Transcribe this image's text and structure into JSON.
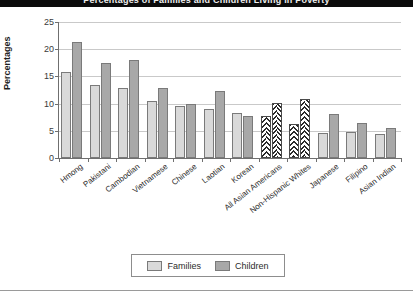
{
  "figure": {
    "title_band_text": "Percentages of Families and Children Living in Poverty",
    "legend_position": "bottom-center"
  },
  "chart_data": {
    "type": "bar",
    "title": "Percentages of Families and Children Living in Poverty",
    "xlabel": "",
    "ylabel": "Percentages",
    "ylim": [
      0,
      25
    ],
    "yticks": [
      0,
      5,
      10,
      15,
      20,
      25
    ],
    "grid": true,
    "categories": [
      "Hmong",
      "Pakistani",
      "Cambodian",
      "Vietnamese",
      "Chinese",
      "Laotian",
      "Korean",
      "All Asian Americans",
      "Non-Hispanic Whites",
      "Japanese",
      "Filipino",
      "Asian Indian"
    ],
    "series": [
      {
        "name": "Families",
        "color": "#d9d9d9",
        "values": [
          15.8,
          13.4,
          12.9,
          10.5,
          9.6,
          9.0,
          8.2,
          7.8,
          6.2,
          4.6,
          4.7,
          4.4
        ]
      },
      {
        "name": "Children",
        "color": "#a8a8a8",
        "values": [
          21.4,
          17.4,
          18.0,
          12.9,
          9.9,
          12.3,
          7.8,
          10.2,
          10.8,
          8.1,
          6.5,
          5.5
        ]
      }
    ],
    "highlighted_categories": [
      "All Asian Americans",
      "Non-Hispanic Whites"
    ],
    "highlight_style": "diagonal-hatch",
    "legend": [
      "Families",
      "Children"
    ]
  },
  "legend": {
    "families_label": "Families",
    "children_label": "Children"
  }
}
